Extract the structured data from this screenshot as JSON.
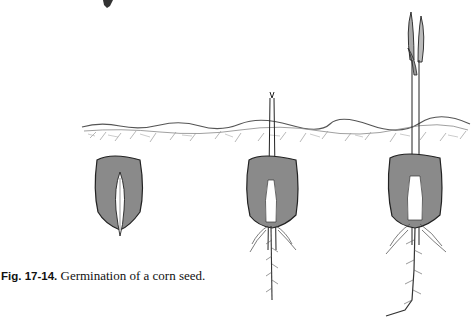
{
  "figure": {
    "label": "Fig. 17-14.",
    "caption": "Germination of a corn seed.",
    "stages": [
      {
        "name": "seed",
        "description": "Ungerminated corn seed below soil"
      },
      {
        "name": "early-seedling",
        "description": "Seed with emerging shoot and primary root"
      },
      {
        "name": "later-seedling",
        "description": "Seedling with leaves above soil and branched roots"
      }
    ],
    "colors": {
      "seed_fill": "#8a8a8a",
      "ink": "#222222",
      "background": "#ffffff"
    }
  }
}
